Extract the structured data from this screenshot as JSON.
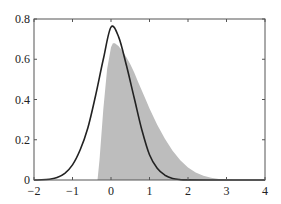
{
  "chart_data": {
    "type": "area",
    "title": "",
    "xlabel": "",
    "ylabel": "",
    "xlim": [
      -2,
      4
    ],
    "ylim": [
      0,
      0.8
    ],
    "grid": false,
    "legend": null,
    "x_ticks": [
      -2,
      -1,
      0,
      1,
      2,
      3,
      4
    ],
    "x_tick_labels": [
      "−2",
      "−1",
      "0",
      "1",
      "2",
      "3",
      "4"
    ],
    "y_ticks": [
      0,
      0.2,
      0.4,
      0.6,
      0.8
    ],
    "y_tick_labels": [
      "0",
      "0.2",
      "0.4",
      "0.6",
      "0.8"
    ],
    "series": [
      {
        "name": "skewed-density-filled",
        "style": "filled-area",
        "color": "#bdbdbd",
        "x": [
          -0.35,
          -0.3,
          -0.2,
          -0.1,
          0.0,
          0.05,
          0.1,
          0.2,
          0.3,
          0.4,
          0.5,
          0.6,
          0.7,
          0.8,
          0.9,
          1.0,
          1.2,
          1.4,
          1.6,
          1.8,
          2.0,
          2.2,
          2.4,
          2.6,
          2.8,
          3.0,
          3.2
        ],
        "y": [
          0.0,
          0.1,
          0.35,
          0.55,
          0.66,
          0.68,
          0.68,
          0.665,
          0.64,
          0.61,
          0.575,
          0.535,
          0.49,
          0.445,
          0.4,
          0.355,
          0.275,
          0.205,
          0.145,
          0.098,
          0.062,
          0.037,
          0.021,
          0.011,
          0.005,
          0.002,
          0.0
        ]
      },
      {
        "name": "normal-density-curve",
        "style": "line",
        "color": "#222222",
        "x": [
          -2.0,
          -1.8,
          -1.6,
          -1.4,
          -1.2,
          -1.0,
          -0.8,
          -0.6,
          -0.4,
          -0.2,
          0.0,
          0.2,
          0.4,
          0.6,
          0.8,
          1.0,
          1.2,
          1.4,
          1.6,
          1.8,
          2.0,
          2.5,
          3.0,
          3.5,
          4.0
        ],
        "y": [
          0.0,
          0.001,
          0.004,
          0.012,
          0.033,
          0.075,
          0.15,
          0.26,
          0.42,
          0.6,
          0.76,
          0.71,
          0.57,
          0.41,
          0.25,
          0.125,
          0.058,
          0.024,
          0.008,
          0.002,
          0.0005,
          0.0,
          0.0,
          0.0,
          0.0
        ]
      }
    ]
  },
  "layout": {
    "plot_left": 34,
    "plot_right": 265,
    "plot_top": 19,
    "plot_bottom": 180
  }
}
